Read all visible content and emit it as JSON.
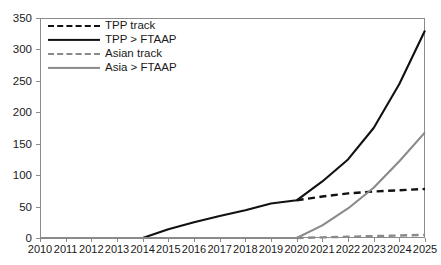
{
  "faint_header": "",
  "chart_data": {
    "type": "line",
    "title": "",
    "subtitle": "",
    "xlabel": "",
    "ylabel": "",
    "x": [
      2010,
      2011,
      2012,
      2013,
      2014,
      2015,
      2016,
      2017,
      2018,
      2019,
      2020,
      2021,
      2022,
      2023,
      2024,
      2025
    ],
    "categories": [
      "2010",
      "2011",
      "2012",
      "2013",
      "2014",
      "2015",
      "2016",
      "2017",
      "2018",
      "2019",
      "2020",
      "2021",
      "2022",
      "2023",
      "2024",
      "2025"
    ],
    "xlim": [
      2010,
      2025
    ],
    "ylim": [
      0,
      350
    ],
    "yticks": [
      0,
      50,
      100,
      150,
      200,
      250,
      300,
      350
    ],
    "ytick_labels": [
      "0",
      "50",
      "100",
      "150",
      "200",
      "250",
      "300",
      "350"
    ],
    "grid": false,
    "legend_position": "top-left",
    "series": [
      {
        "name": "TPP track",
        "style": "dashed",
        "color": "#111111",
        "values": [
          null,
          null,
          null,
          null,
          null,
          null,
          null,
          null,
          null,
          null,
          60,
          66,
          71,
          74,
          76,
          78
        ]
      },
      {
        "name": "TPP > FTAAP",
        "style": "solid",
        "color": "#111111",
        "values": [
          0,
          0,
          0,
          0,
          0,
          14,
          25,
          35,
          44,
          55,
          60,
          90,
          125,
          175,
          245,
          330
        ]
      },
      {
        "name": "Asian track",
        "style": "dashed",
        "color": "#8a8a8a",
        "values": [
          null,
          null,
          null,
          null,
          null,
          null,
          null,
          null,
          null,
          null,
          0,
          1,
          2,
          3,
          4,
          5
        ]
      },
      {
        "name": "Asia > FTAAP",
        "style": "solid",
        "color": "#8a8a8a",
        "values": [
          0,
          0,
          0,
          0,
          0,
          0,
          0,
          0,
          0,
          0,
          0,
          20,
          47,
          80,
          122,
          168
        ]
      }
    ]
  },
  "legend": {
    "items": [
      {
        "label": "TPP track",
        "key": "dash-black"
      },
      {
        "label": "TPP > FTAAP",
        "key": "solid-black"
      },
      {
        "label": "Asian track",
        "key": "dash-gray"
      },
      {
        "label": "Asia > FTAAP",
        "key": "solid-gray"
      }
    ]
  }
}
